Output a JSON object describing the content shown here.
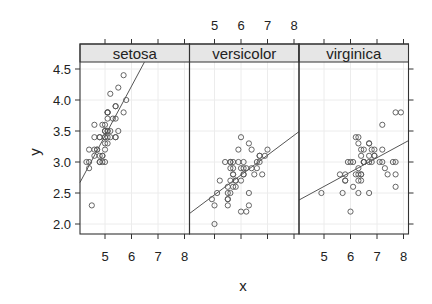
{
  "chart_data": {
    "type": "scatter",
    "layout": "trellis panels (1 row x 3 columns), shared axes",
    "xlabel": "x",
    "ylabel": "y",
    "xlim": [
      4.06,
      8.2
    ],
    "ylim": [
      1.83,
      4.6
    ],
    "x_ticks": [
      5,
      6,
      7,
      8
    ],
    "y_ticks": [
      2.0,
      2.5,
      3.0,
      3.5,
      4.0,
      4.5
    ],
    "y_tick_labels": [
      "2.0",
      "2.5",
      "3.0",
      "3.5",
      "4.0",
      "4.5"
    ],
    "x_tick_labels": [
      "5",
      "6",
      "7",
      "8"
    ],
    "grid": true,
    "marker": "open circle",
    "colors": {
      "points": "#555555",
      "line": "#555555",
      "strip_bg": "#e6e6e6",
      "grid": "#ececec",
      "frame": "#333333"
    },
    "panels": [
      {
        "label": "setosa",
        "regression": {
          "intercept": -0.569,
          "slope": 0.7985
        },
        "x": [
          5.1,
          4.9,
          4.7,
          4.6,
          5.0,
          5.4,
          4.6,
          5.0,
          4.4,
          4.9,
          5.4,
          4.8,
          4.8,
          4.3,
          5.8,
          5.7,
          5.4,
          5.1,
          5.7,
          5.1,
          5.4,
          5.1,
          4.6,
          5.1,
          4.8,
          5.0,
          5.0,
          5.2,
          5.2,
          4.7,
          4.8,
          5.4,
          5.2,
          5.5,
          4.9,
          5.0,
          5.5,
          4.9,
          4.4,
          5.1,
          5.0,
          4.5,
          4.4,
          5.0,
          5.1,
          4.8,
          5.1,
          4.6,
          5.3,
          5.0
        ],
        "y": [
          3.5,
          3.0,
          3.2,
          3.1,
          3.6,
          3.9,
          3.4,
          3.4,
          2.9,
          3.1,
          3.7,
          3.4,
          3.0,
          3.0,
          4.0,
          4.4,
          3.9,
          3.5,
          3.8,
          3.8,
          3.4,
          3.7,
          3.6,
          3.3,
          3.4,
          3.0,
          3.4,
          3.5,
          3.4,
          3.2,
          3.1,
          3.4,
          4.1,
          4.2,
          3.1,
          3.2,
          3.5,
          3.6,
          3.0,
          3.4,
          3.5,
          2.3,
          3.2,
          3.5,
          3.8,
          3.0,
          3.8,
          3.2,
          3.7,
          3.3
        ]
      },
      {
        "label": "versicolor",
        "regression": {
          "intercept": 0.872,
          "slope": 0.3197
        },
        "x": [
          7.0,
          6.4,
          6.9,
          5.5,
          6.5,
          5.7,
          6.3,
          4.9,
          6.6,
          5.2,
          5.0,
          5.9,
          6.0,
          6.1,
          5.6,
          6.7,
          5.6,
          5.8,
          6.2,
          5.6,
          5.9,
          6.1,
          6.3,
          6.1,
          6.4,
          6.6,
          6.8,
          6.7,
          6.0,
          5.7,
          5.5,
          5.5,
          5.8,
          6.0,
          5.4,
          6.0,
          6.7,
          6.3,
          5.6,
          5.5,
          5.5,
          6.1,
          5.8,
          5.0,
          5.6,
          5.7,
          5.7,
          6.2,
          5.1,
          5.7
        ],
        "y": [
          3.2,
          3.2,
          3.1,
          2.3,
          2.8,
          2.8,
          3.3,
          2.4,
          2.9,
          2.7,
          2.0,
          3.0,
          2.2,
          2.9,
          2.9,
          3.1,
          3.0,
          2.7,
          2.2,
          2.5,
          3.2,
          2.8,
          2.5,
          2.8,
          2.9,
          3.0,
          2.8,
          3.0,
          2.9,
          2.6,
          2.4,
          2.4,
          2.7,
          2.7,
          3.0,
          3.4,
          3.1,
          2.3,
          3.0,
          2.5,
          2.6,
          3.0,
          2.6,
          2.3,
          2.7,
          3.0,
          2.9,
          2.9,
          2.5,
          2.8
        ]
      },
      {
        "label": "virginica",
        "regression": {
          "intercept": 1.446,
          "slope": 0.2319
        },
        "x": [
          6.3,
          5.8,
          7.1,
          6.3,
          6.5,
          7.6,
          4.9,
          7.3,
          6.7,
          7.2,
          6.5,
          6.4,
          6.8,
          5.7,
          5.8,
          6.4,
          6.5,
          7.7,
          7.7,
          6.0,
          6.9,
          5.6,
          7.7,
          6.3,
          6.7,
          7.2,
          6.2,
          6.1,
          6.4,
          7.2,
          7.4,
          7.9,
          6.4,
          6.3,
          6.1,
          7.7,
          6.3,
          6.4,
          6.0,
          6.9,
          6.7,
          6.9,
          5.8,
          6.8,
          6.7,
          6.7,
          6.3,
          6.5,
          6.2,
          5.9
        ],
        "y": [
          3.3,
          2.7,
          3.0,
          2.9,
          3.0,
          3.0,
          2.5,
          2.9,
          2.5,
          3.6,
          3.2,
          2.7,
          3.0,
          2.5,
          2.8,
          3.2,
          3.0,
          3.8,
          2.6,
          2.2,
          3.2,
          2.8,
          2.8,
          2.7,
          3.3,
          3.2,
          2.8,
          3.0,
          2.8,
          3.0,
          2.8,
          3.8,
          2.8,
          2.8,
          2.6,
          3.0,
          3.4,
          3.1,
          3.0,
          3.1,
          3.1,
          3.1,
          2.7,
          3.2,
          3.3,
          3.0,
          2.5,
          3.0,
          3.4,
          3.0
        ]
      }
    ]
  }
}
